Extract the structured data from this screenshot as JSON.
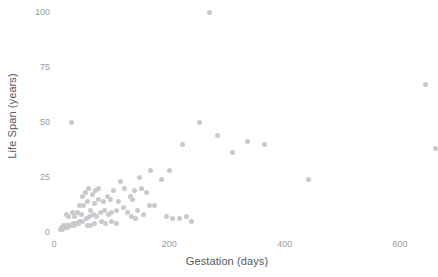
{
  "chart_data": {
    "type": "scatter",
    "title": "",
    "xlabel": "Gestation (days)",
    "ylabel": "Life Span (years)",
    "xlim": [
      0,
      650
    ],
    "ylim": [
      0,
      100
    ],
    "xticks": [
      0,
      200,
      400,
      600
    ],
    "yticks": [
      0,
      25,
      50,
      75,
      100
    ],
    "grid": false,
    "legend": null,
    "marker": {
      "color": "#c9c9ce",
      "size": 5,
      "shape": "circle"
    },
    "series": [
      {
        "name": "animals",
        "points": [
          [
            270,
            100
          ],
          [
            31,
            50
          ],
          [
            252,
            50
          ],
          [
            645,
            67
          ],
          [
            661,
            38
          ],
          [
            365,
            40
          ],
          [
            335,
            41
          ],
          [
            284,
            44
          ],
          [
            223,
            40
          ],
          [
            310,
            36
          ],
          [
            441,
            24
          ],
          [
            200,
            28
          ],
          [
            167,
            28
          ],
          [
            148,
            25
          ],
          [
            186,
            24
          ],
          [
            151,
            20
          ],
          [
            122,
            20
          ],
          [
            115,
            23
          ],
          [
            104,
            19
          ],
          [
            132,
            16
          ],
          [
            136,
            15
          ],
          [
            139,
            19
          ],
          [
            112,
            14
          ],
          [
            98,
            15
          ],
          [
            92,
            16
          ],
          [
            85,
            14
          ],
          [
            77,
            15
          ],
          [
            70,
            13
          ],
          [
            63,
            10
          ],
          [
            160,
            18
          ],
          [
            165,
            12
          ],
          [
            175,
            12
          ],
          [
            195,
            7
          ],
          [
            205,
            6
          ],
          [
            218,
            6
          ],
          [
            230,
            7
          ],
          [
            238,
            5
          ],
          [
            108,
            10
          ],
          [
            100,
            9
          ],
          [
            95,
            8
          ],
          [
            88,
            10
          ],
          [
            81,
            9
          ],
          [
            74,
            7
          ],
          [
            68,
            8
          ],
          [
            61,
            7
          ],
          [
            56,
            6
          ],
          [
            50,
            5
          ],
          [
            45,
            5
          ],
          [
            42,
            4
          ],
          [
            38,
            4
          ],
          [
            35,
            3
          ],
          [
            33,
            4
          ],
          [
            30,
            3
          ],
          [
            28,
            3
          ],
          [
            25,
            3
          ],
          [
            23,
            2
          ],
          [
            21,
            3
          ],
          [
            20,
            2
          ],
          [
            18,
            2
          ],
          [
            17,
            3
          ],
          [
            16,
            2
          ],
          [
            15,
            2
          ],
          [
            14,
            1
          ],
          [
            13,
            2
          ],
          [
            12,
            1
          ],
          [
            45,
            12
          ],
          [
            52,
            12
          ],
          [
            58,
            14
          ],
          [
            66,
            17
          ],
          [
            72,
            19
          ],
          [
            78,
            20
          ],
          [
            120,
            11
          ],
          [
            128,
            9
          ],
          [
            145,
            10
          ],
          [
            155,
            8
          ],
          [
            48,
            8
          ],
          [
            40,
            9
          ],
          [
            36,
            7
          ],
          [
            58,
            3
          ],
          [
            64,
            3
          ],
          [
            70,
            4
          ],
          [
            82,
            5
          ],
          [
            90,
            4
          ],
          [
            100,
            5
          ],
          [
            108,
            4
          ],
          [
            134,
            7
          ],
          [
            142,
            6
          ],
          [
            26,
            7
          ],
          [
            22,
            8
          ],
          [
            32,
            9
          ],
          [
            54,
            18
          ],
          [
            60,
            20
          ],
          [
            49,
            16
          ]
        ]
      }
    ]
  },
  "axes": {
    "x_tick_labels": [
      "0",
      "200",
      "400",
      "600"
    ],
    "y_tick_labels": [
      "0",
      "25",
      "50",
      "75",
      "100"
    ]
  }
}
